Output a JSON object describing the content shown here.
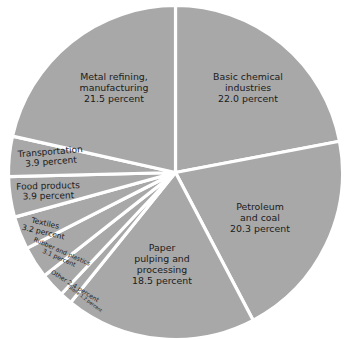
{
  "chart_data": {
    "type": "pie",
    "title": "",
    "subtitle": "",
    "xlabel": "",
    "ylabel": "",
    "legend_position": "none",
    "grid": false,
    "value_unit": "percent",
    "fill_color": "#a8a8a8",
    "separator_color": "#ffffff",
    "background_color": "#ffffff",
    "categories": [
      "Basic chemical industries",
      "Petroleum and coal",
      "Paper pulping and processing",
      "Stone",
      "Other",
      "Rubber and plastics",
      "Textiles",
      "Food products",
      "Transportation",
      "Metal refining, manufacturing"
    ],
    "values": [
      22.0,
      20.3,
      18.5,
      1.2,
      2.4,
      3.1,
      3.2,
      3.9,
      3.9,
      21.5
    ],
    "slices": [
      {
        "name": "basic-chemical-industries",
        "lines": [
          "Basic chemical",
          "industries",
          "22.0 percent"
        ],
        "value": 22.0,
        "start_angle": 0.0,
        "end_angle": 79.2
      },
      {
        "name": "petroleum-and-coal",
        "lines": [
          "Petroleum",
          "and coal",
          "20.3 percent"
        ],
        "value": 20.3,
        "start_angle": 79.2,
        "end_angle": 152.3
      },
      {
        "name": "paper-pulping-and-processing",
        "lines": [
          "Paper",
          "pulping and",
          "processing",
          "18.5 percent"
        ],
        "value": 18.5,
        "start_angle": 152.3,
        "end_angle": 218.9
      },
      {
        "name": "stone",
        "lines": [
          "Stone 1.2 percent"
        ],
        "value": 1.2,
        "start_angle": 218.9,
        "end_angle": 223.2
      },
      {
        "name": "other",
        "lines": [
          "Other 2.4 percent"
        ],
        "value": 2.4,
        "start_angle": 223.2,
        "end_angle": 231.8
      },
      {
        "name": "rubber-and-plastics",
        "lines": [
          "Rubber and plastics",
          "3.1 percent"
        ],
        "value": 3.1,
        "start_angle": 231.8,
        "end_angle": 243.0
      },
      {
        "name": "textiles",
        "lines": [
          "Textiles",
          "3.2 percent"
        ],
        "value": 3.2,
        "start_angle": 243.0,
        "end_angle": 254.5
      },
      {
        "name": "food-products",
        "lines": [
          "Food products",
          "3.9 percent"
        ],
        "value": 3.9,
        "start_angle": 254.5,
        "end_angle": 268.6
      },
      {
        "name": "transportation",
        "lines": [
          "Transportation",
          "3.9 percent"
        ],
        "value": 3.9,
        "start_angle": 268.6,
        "end_angle": 282.6
      },
      {
        "name": "metal-refining-manufacturing",
        "lines": [
          "Metal refining,",
          "manufacturing",
          "21.5 percent"
        ],
        "value": 21.5,
        "start_angle": 282.6,
        "end_angle": 360.0
      }
    ]
  },
  "labels": {
    "basic_chemical": {
      "l1": "Basic chemical",
      "l2": "industries",
      "l3": "22.0 percent"
    },
    "metal_refining": {
      "l1": "Metal refining,",
      "l2": "manufacturing",
      "l3": "21.5 percent"
    },
    "petroleum": {
      "l1": "Petroleum",
      "l2": "and coal",
      "l3": "20.3 percent"
    },
    "paper": {
      "l1": "Paper",
      "l2": "pulping and",
      "l3": "processing",
      "l4": "18.5 percent"
    },
    "transportation": {
      "l1": "Transportation",
      "l2": "3.9 percent"
    },
    "food_products": {
      "l1": "Food products",
      "l2": "3.9 percent"
    },
    "textiles": {
      "l1": "Textiles",
      "l2": "3.2 percent"
    },
    "rubber": {
      "l1": "Rubber and plastics",
      "l2": "3.1 percent"
    },
    "other": {
      "l1": "Other 2.4 percent"
    },
    "stone": {
      "l1": "Stone 1.2 percent"
    }
  }
}
